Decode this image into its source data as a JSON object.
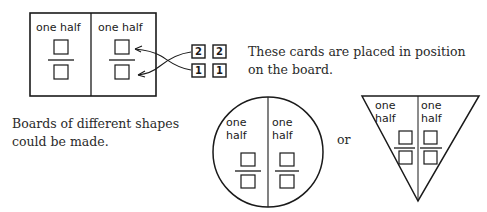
{
  "rect_board": {
    "left_label": "one half",
    "right_label": "one half"
  },
  "cards": {
    "top_row": [
      "2",
      "2"
    ],
    "bottom_row": [
      "1",
      "1"
    ]
  },
  "caption_cards": {
    "line1": "These cards are placed in position",
    "line2": "on the board."
  },
  "caption_shapes": {
    "line1": "Boards of different shapes",
    "line2": "could be made."
  },
  "circle_board": {
    "left_label_line1": "one",
    "left_label_line2": "half",
    "right_label_line1": "one",
    "right_label_line2": "half"
  },
  "connector_text": "or",
  "triangle_board": {
    "left_label_line1": "one",
    "left_label_line2": "half",
    "right_label_line1": "one",
    "right_label_line2": "half"
  }
}
